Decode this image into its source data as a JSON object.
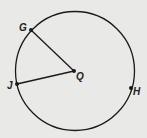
{
  "diagram": {
    "type": "circle",
    "center": {
      "label": "Q",
      "x": 74,
      "y": 71
    },
    "circle": {
      "cx": 75,
      "cy": 71,
      "r": 59
    },
    "points": [
      {
        "label": "G",
        "x": 31,
        "y": 30
      },
      {
        "label": "J",
        "x": 17,
        "y": 84
      },
      {
        "label": "H",
        "x": 131,
        "y": 88
      }
    ],
    "segments": [
      {
        "from": "Q",
        "to": "G"
      },
      {
        "from": "Q",
        "to": "J"
      }
    ],
    "colors": {
      "stroke": "#1a1a1a",
      "background": "#e9e9e7"
    }
  }
}
